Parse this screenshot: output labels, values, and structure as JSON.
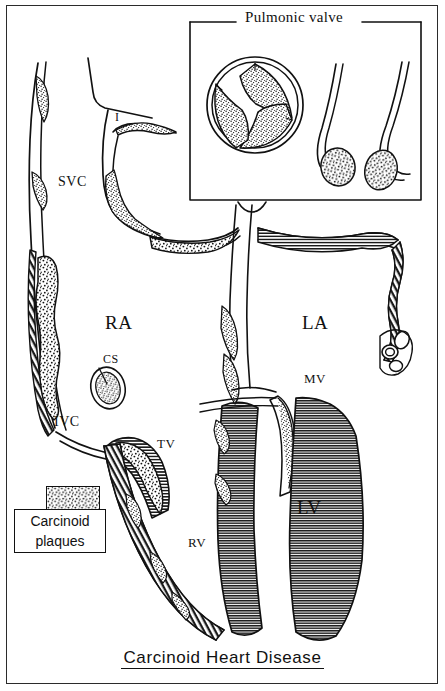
{
  "figure": {
    "caption": "Carcinoid Heart Disease",
    "frame_color": "#2b2b2b",
    "ink_color": "#111111",
    "paper_color": "#ffffff"
  },
  "inset": {
    "title": "Pulmonic valve"
  },
  "legend": {
    "line1": "Carcinoid",
    "line2": "plaques",
    "swatch_name": "carcinoid-plaque-stipple"
  },
  "labels": {
    "innominate": "I",
    "svc": "SVC",
    "ivc": "IVC",
    "right_atrium": "RA",
    "coronary_sinus": "CS",
    "tricuspid_valve": "TV",
    "right_ventricle": "RV",
    "left_atrium": "LA",
    "mitral_valve": "MV",
    "left_ventricle": "LV"
  }
}
